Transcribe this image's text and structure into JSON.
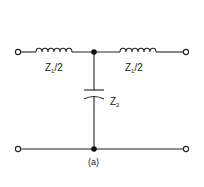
{
  "diagram": {
    "type": "T-network filter section",
    "caption": "(a)",
    "components": {
      "left_inductor": {
        "label_main": "Z",
        "label_sub": "1",
        "label_suffix": "/2"
      },
      "right_inductor": {
        "label_main": "Z",
        "label_sub": "1",
        "label_suffix": "/2"
      },
      "shunt_capacitor": {
        "label_main": "Z",
        "label_sub": "2"
      }
    },
    "colors": {
      "line": "#222222",
      "background": "#ffffff"
    }
  }
}
